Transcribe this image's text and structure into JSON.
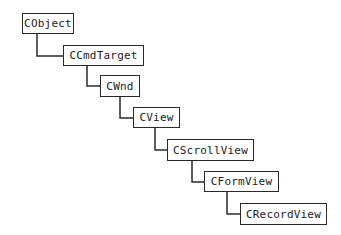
{
  "diagram": {
    "nodes": [
      {
        "id": "cobject",
        "label": "CObject"
      },
      {
        "id": "ccmdtarget",
        "label": "CCmdTarget"
      },
      {
        "id": "cwnd",
        "label": "CWnd"
      },
      {
        "id": "cview",
        "label": "CView"
      },
      {
        "id": "cscrollview",
        "label": "CScrollView"
      },
      {
        "id": "cformview",
        "label": "CFormView"
      },
      {
        "id": "crecordview",
        "label": "CRecordView"
      }
    ],
    "edges": [
      {
        "from": "cobject",
        "to": "ccmdtarget"
      },
      {
        "from": "ccmdtarget",
        "to": "cwnd"
      },
      {
        "from": "cwnd",
        "to": "cview"
      },
      {
        "from": "cview",
        "to": "cscrollview"
      },
      {
        "from": "cscrollview",
        "to": "cformview"
      },
      {
        "from": "cformview",
        "to": "crecordview"
      }
    ],
    "colors": {
      "line": "#2a2a2a",
      "box_border": "#2a2a2a",
      "text": "#222222",
      "background": "#ffffff"
    }
  }
}
